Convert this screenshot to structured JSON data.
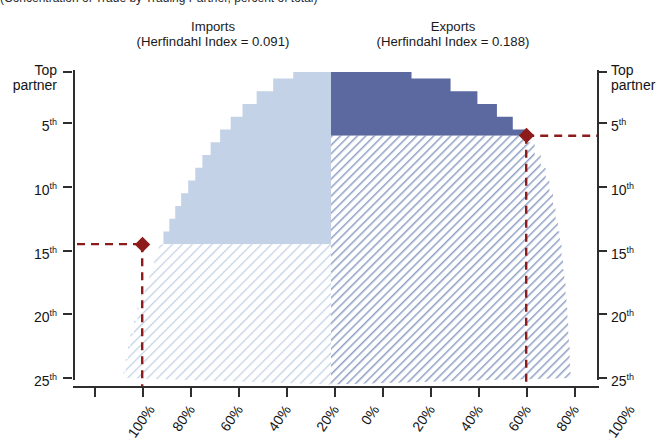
{
  "figure": {
    "cut_caption": "(Concentration of Trade by Trading Partner, percent of total)",
    "imports_title_line1": "Imports",
    "imports_title_line2": "(Herfindahl Index = 0.091)",
    "exports_title_line1": "Exports",
    "exports_title_line2": "(Herfindahl Index = 0.188)"
  },
  "colors": {
    "imports_fill": "#c3d2e6",
    "exports_fill": "#5c68a0",
    "hatch_line": "#8fa0c4",
    "imports_hatch_line": "#c3d2e6",
    "marker": "#8e1b1b",
    "axis": "#2e2e2e",
    "background": "#ffffff"
  },
  "axes": {
    "y_left_label_top": "Top",
    "y_left_label_top2": "partner",
    "y_right_label_top": "Top",
    "y_right_label_top2": "partner",
    "y_ticks": [
      {
        "rank": 1,
        "label": "",
        "sup": ""
      },
      {
        "rank": 5,
        "label": "5",
        "sup": "th"
      },
      {
        "rank": 10,
        "label": "10",
        "sup": "th"
      },
      {
        "rank": 15,
        "label": "15",
        "sup": "th"
      },
      {
        "rank": 20,
        "label": "20",
        "sup": "th"
      },
      {
        "rank": 25,
        "label": "25",
        "sup": "th"
      }
    ],
    "x_ticks": [
      "100%",
      "80%",
      "60%",
      "40%",
      "20%",
      "0%",
      "20%",
      "40%",
      "60%",
      "80%",
      "100%"
    ],
    "x_center_value": "0%",
    "y_axis_title": "Top partner",
    "x_axis_units": "percent of total trade (cumulative)"
  },
  "chart_data": {
    "type": "area",
    "title": "Concentration of Trade by Trading Partner",
    "subtitle": "Imports (Herfindahl Index = 0.091)  |  Exports (Herfindahl Index = 0.188)",
    "xlabel": "Cumulative share of trade (percent)",
    "ylabel": "Trading partner rank",
    "orientation": "diverging-horizontal",
    "grid": false,
    "legend_position": "none",
    "xlim": [
      -100,
      100
    ],
    "ylim_rank": [
      1,
      25
    ],
    "x_tick_values": [
      -100,
      -80,
      -60,
      -40,
      -20,
      0,
      20,
      40,
      60,
      80,
      100
    ],
    "x_tick_labels": [
      "100%",
      "80%",
      "60%",
      "40%",
      "20%",
      "0%",
      "20%",
      "40%",
      "60%",
      "80%",
      "100%"
    ],
    "y_tick_values": [
      1,
      5,
      10,
      15,
      20,
      25
    ],
    "y_tick_labels": [
      "Top partner",
      "5th",
      "10th",
      "15th",
      "20th",
      "25th"
    ],
    "ranks": [
      1,
      2,
      3,
      4,
      5,
      6,
      7,
      8,
      9,
      10,
      11,
      12,
      13,
      14,
      15,
      16,
      17,
      18,
      19,
      20,
      21,
      22,
      23,
      24,
      25
    ],
    "series": [
      {
        "name": "Imports",
        "herfindahl_index": 0.091,
        "direction": "left",
        "marker_rank": 14.5,
        "marker_cumulative_pct": 80,
        "cumulative_pct": [
          16.0,
          24.5,
          31.5,
          37.5,
          42.5,
          47.0,
          51.0,
          54.5,
          57.5,
          60.5,
          63.5,
          66.0,
          68.5,
          71.0,
          73.0,
          75.0,
          77.0,
          79.0,
          80.5,
          82.0,
          83.5,
          85.0,
          86.0,
          87.0,
          88.0
        ]
      },
      {
        "name": "Exports",
        "herfindahl_index": 0.188,
        "direction": "right",
        "marker_rank": 6.0,
        "marker_cumulative_pct": 80,
        "cumulative_pct": [
          33.0,
          49.0,
          60.0,
          68.0,
          74.5,
          80.0,
          83.5,
          86.0,
          88.0,
          89.5,
          91.0,
          92.0,
          93.0,
          93.8,
          94.5,
          95.1,
          95.6,
          96.1,
          96.5,
          96.9,
          97.2,
          97.5,
          97.8,
          98.0,
          98.2
        ]
      }
    ],
    "markers": [
      {
        "series": "Imports",
        "rank": 14.5,
        "cumulative_pct": 80,
        "shape": "diamond",
        "color": "#8e1b1b"
      },
      {
        "series": "Exports",
        "rank": 6.0,
        "cumulative_pct": 80,
        "shape": "diamond",
        "color": "#8e1b1b"
      }
    ],
    "annotations": [
      {
        "type": "dashed-guide",
        "series": "Imports",
        "orientation": "horizontal",
        "rank": 14.5
      },
      {
        "type": "dashed-guide",
        "series": "Imports",
        "orientation": "vertical",
        "cumulative_pct": 80
      },
      {
        "type": "dashed-guide",
        "series": "Exports",
        "orientation": "horizontal",
        "rank": 6.0
      },
      {
        "type": "dashed-guide",
        "series": "Exports",
        "orientation": "vertical",
        "cumulative_pct": 80
      }
    ]
  }
}
